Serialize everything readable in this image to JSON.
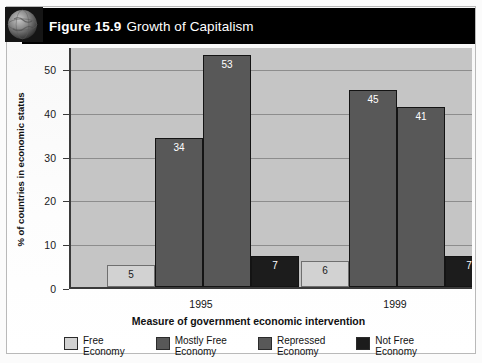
{
  "figure": {
    "number_label": "Figure 15.9",
    "title": "Growth of Capitalism",
    "badge_icon": "globe-icon"
  },
  "chart_data": {
    "type": "bar",
    "title": "Growth of Capitalism",
    "xlabel": "Measure of government economic intervention",
    "ylabel": "% of countries in economic status",
    "categories": [
      "1995",
      "1999"
    ],
    "ylim": [
      0,
      55
    ],
    "yticks": [
      0,
      10,
      20,
      30,
      40,
      50
    ],
    "ytick_labels": [
      "0",
      "10",
      "20",
      "30",
      "40",
      "50"
    ],
    "grid": true,
    "legend_position": "bottom",
    "series": [
      {
        "name": "Free\nEconomy",
        "color": "#d2d2d2",
        "values": [
          5,
          6
        ]
      },
      {
        "name": "Mostly Free\nEconomy",
        "color": "#585858",
        "values": [
          34,
          45
        ]
      },
      {
        "name": "Repressed\nEconomy",
        "color": "#585858",
        "values": [
          53,
          41
        ]
      },
      {
        "name": "Not Free\nEconomy",
        "color": "#1c1c1c",
        "values": [
          7,
          7
        ]
      }
    ],
    "bar_labels": [
      [
        "5",
        "34",
        "53",
        "7"
      ],
      [
        "6",
        "45",
        "41",
        "7"
      ]
    ]
  },
  "colors": {
    "header_bar": "#000000",
    "plot_background": "#c5c5c5",
    "gridline": "#8d8d8d",
    "axis": "#3a3a3a",
    "page": "#fbfbfb"
  }
}
